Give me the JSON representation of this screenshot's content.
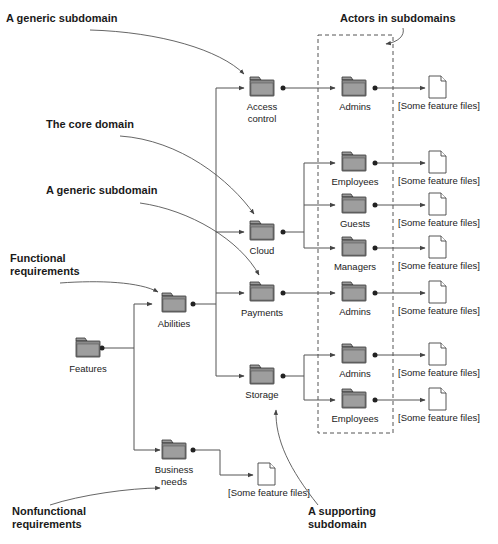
{
  "diagram": {
    "callouts": [
      {
        "id": "generic-subdomain-1",
        "lines": [
          "A generic subdomain"
        ]
      },
      {
        "id": "core-domain",
        "lines": [
          "The core domain"
        ]
      },
      {
        "id": "generic-subdomain-2",
        "lines": [
          "A generic subdomain"
        ]
      },
      {
        "id": "functional-requirements",
        "lines": [
          "Functional",
          "requirements"
        ]
      },
      {
        "id": "nonfunctional-requirements",
        "lines": [
          "Nonfunctional",
          "requirements"
        ]
      },
      {
        "id": "actors-in-subdomains",
        "lines": [
          "Actors in subdomains"
        ]
      },
      {
        "id": "supporting-subdomain",
        "lines": [
          "A supporting",
          "subdomain"
        ]
      }
    ],
    "folders": {
      "features": {
        "lines": [
          "Features"
        ]
      },
      "abilities": {
        "lines": [
          "Abilities"
        ]
      },
      "business_needs": {
        "lines": [
          "Business",
          "needs"
        ]
      },
      "access_control": {
        "lines": [
          "Access",
          "control"
        ]
      },
      "cloud": {
        "lines": [
          "Cloud"
        ]
      },
      "payments": {
        "lines": [
          "Payments"
        ]
      },
      "storage": {
        "lines": [
          "Storage"
        ]
      },
      "admins_access": {
        "lines": [
          "Admins"
        ]
      },
      "employees_cloud": {
        "lines": [
          "Employees"
        ]
      },
      "guests_cloud": {
        "lines": [
          "Guests"
        ]
      },
      "managers_cloud": {
        "lines": [
          "Managers"
        ]
      },
      "admins_payments": {
        "lines": [
          "Admins"
        ]
      },
      "admins_storage": {
        "lines": [
          "Admins"
        ]
      },
      "employees_storage": {
        "lines": [
          "Employees"
        ]
      }
    },
    "files": {
      "label": "[Some feature files]",
      "count": 8
    }
  }
}
